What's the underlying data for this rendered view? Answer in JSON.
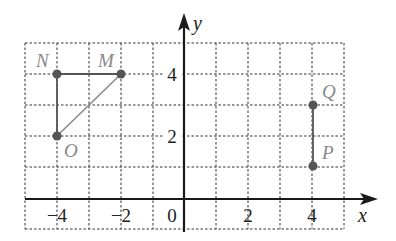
{
  "axes": {
    "x_label": "x",
    "y_label": "y",
    "origin_label": "0",
    "x_ticks": [
      {
        "value": -4,
        "label": "−4"
      },
      {
        "value": -2,
        "label": "−2"
      },
      {
        "value": 2,
        "label": "2"
      },
      {
        "value": 4,
        "label": "4"
      }
    ],
    "y_ticks": [
      {
        "value": 2,
        "label": "2"
      },
      {
        "value": 4,
        "label": "4"
      }
    ],
    "x_range": [
      -5,
      5
    ],
    "y_range": [
      -1,
      5
    ],
    "grid": "dotted, unit spacing"
  },
  "points": [
    {
      "name": "N",
      "x": -4,
      "y": 4
    },
    {
      "name": "M",
      "x": -2,
      "y": 4
    },
    {
      "name": "O",
      "x": -4,
      "y": 2
    },
    {
      "name": "Q",
      "x": 4,
      "y": 3
    },
    {
      "name": "P",
      "x": 4,
      "y": 1
    }
  ],
  "segments": [
    {
      "from": "N",
      "to": "M"
    },
    {
      "from": "N",
      "to": "O"
    },
    {
      "from": "O",
      "to": "M"
    },
    {
      "from": "P",
      "to": "Q"
    }
  ]
}
